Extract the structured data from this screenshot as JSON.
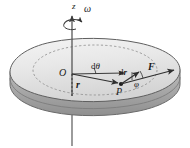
{
  "figure": {
    "background_color": "#ffffff",
    "width": 190,
    "height": 148
  },
  "labels": {
    "axis_z": "z",
    "angular_velocity": "ω",
    "origin": "O",
    "angle_dtheta_d": "d",
    "angle_dtheta_sym": "θ",
    "radius_vector": "r",
    "displacement_d": "d",
    "displacement_sym": "r",
    "force_vector": "F",
    "angle_phi": "φ",
    "point_p": "P"
  },
  "colors": {
    "body_top_fill": "#e6e6e6",
    "body_top_fill_light": "#f2f2f2",
    "body_side_fill": "#b8b8b8",
    "body_side_fill_dark": "#9a9a9a",
    "outline": "#5a5a5a",
    "dashed_circle": "#8a8a8a",
    "vector_stroke": "#3a3a3a",
    "axis_stroke": "#4a4a4a",
    "text": "#1a1a1a"
  },
  "geometry": {
    "origin_point": {
      "x": 72,
      "y": 74
    },
    "point_p": {
      "x": 121,
      "y": 84
    },
    "axis_top": {
      "x": 72,
      "y": 14
    },
    "axis_bottom": {
      "x": 72,
      "y": 146
    },
    "force_tip": {
      "x": 172,
      "y": 71
    },
    "dr_tip": {
      "x": 138,
      "y": 73
    },
    "r_arrow_tip": {
      "x": 118,
      "y": 83
    },
    "dtheta_arc_radius": 24
  },
  "elements": {
    "body_name": "rigid-body-disk",
    "dashed_circle_name": "dashed-radius-circle",
    "axis_name": "z-axis",
    "omega_arrow_name": "omega-rotation-arrow"
  }
}
